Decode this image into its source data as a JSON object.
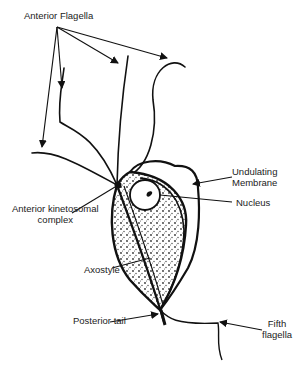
{
  "diagram": {
    "labels": {
      "anterior_flagella": "Anterior Flagella",
      "undulating_membrane_line1": "Undulating",
      "undulating_membrane_line2": "Membrane",
      "nucleus": "Nucleus",
      "anterior_kinetosomal_line1": "Anterior kinetosomal",
      "anterior_kinetosomal_line2": "complex",
      "axostyle": "Axostyle",
      "posterior_tail": "Posterior tail",
      "fifth_flagella_line1": "Fifth",
      "fifth_flagella_line2": "flagella"
    },
    "colors": {
      "ink": "#111111",
      "background": "#ffffff"
    }
  }
}
